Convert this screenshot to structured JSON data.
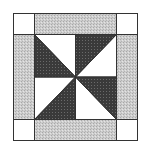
{
  "diagram": {
    "colors": {
      "background": "#ffffff",
      "light_print": "#c8c8c8",
      "dark_print": "#3c3c3c",
      "white_fabric": "#ffffff",
      "outline": "#333333"
    },
    "pieces": {
      "corner_squares": 4,
      "border_strips": 4,
      "pinwheel_dark_triangles": 4,
      "pinwheel_white_triangles": 4
    }
  }
}
